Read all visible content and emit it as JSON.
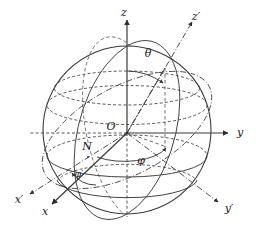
{
  "figure": {
    "background_color": "#ffffff",
    "line_color": "#3a3a3a",
    "label_color": "#1a1a1a"
  },
  "labels": {
    "axis_z": "z",
    "axis_z_prime": "z′",
    "axis_y": "y",
    "axis_y_prime": "y′",
    "axis_x": "x",
    "axis_x_prime": "x′",
    "origin": "O",
    "node": "N",
    "angle_theta": "θ",
    "angle_phi": "φ",
    "angle_phi_prime": "φ′"
  },
  "geometry": {
    "sphere_center_x": 127,
    "sphere_center_y": 130,
    "sphere_radius": 84,
    "origin_x": 127,
    "origin_y": 133
  }
}
